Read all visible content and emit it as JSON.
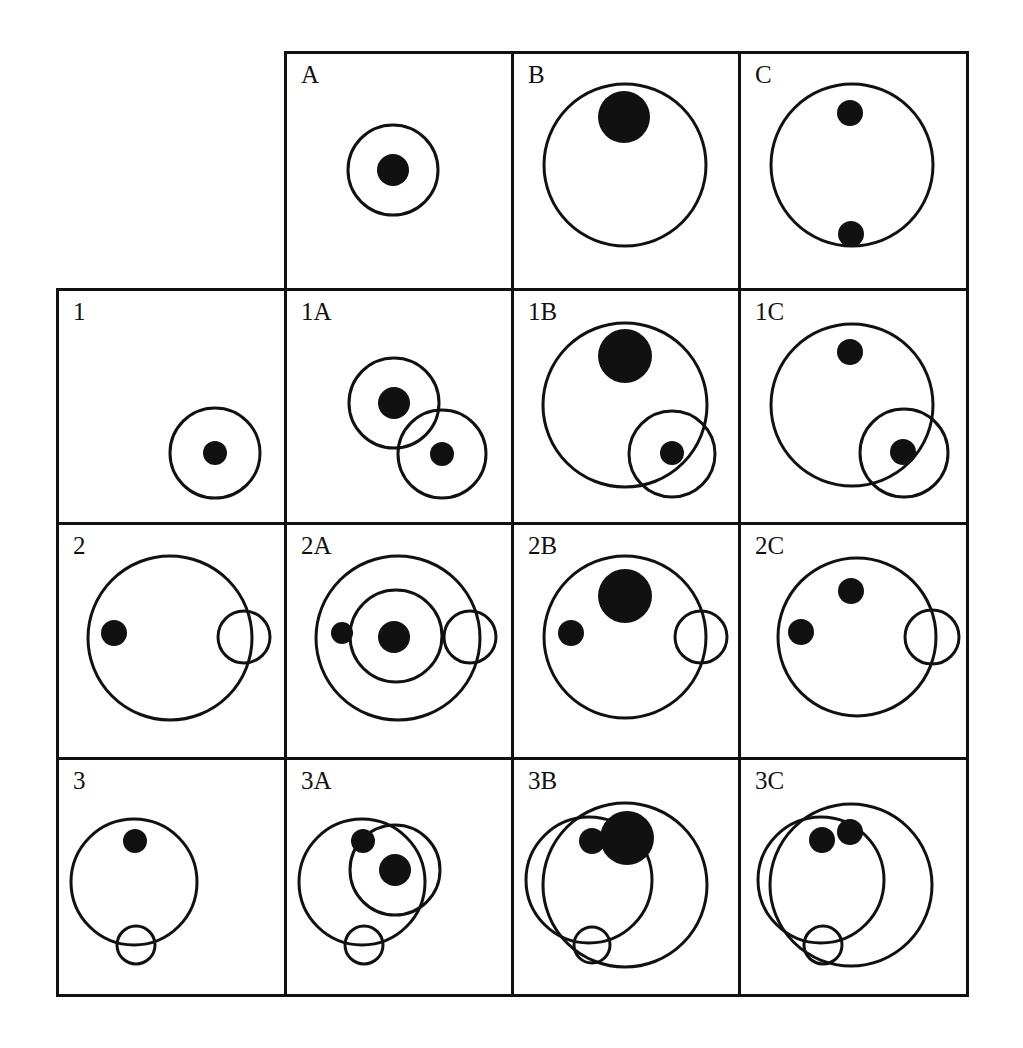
{
  "figure": {
    "title": "",
    "colors": {
      "stroke": "#111111",
      "fill": "#111111",
      "background": "#ffffff"
    },
    "grid": {
      "col_x": [
        57,
        285,
        512,
        739,
        967
      ],
      "row_y": [
        52,
        289,
        523,
        758,
        995
      ]
    },
    "cells": [
      {
        "id": "A",
        "label": "A",
        "row": 0,
        "col": 1,
        "rings": [
          {
            "cx": 108,
            "cy": 118,
            "r": 45
          }
        ],
        "dots": [
          {
            "cx": 108,
            "cy": 118,
            "r": 16
          }
        ]
      },
      {
        "id": "B",
        "label": "B",
        "row": 0,
        "col": 2,
        "rings": [
          {
            "cx": 113,
            "cy": 113,
            "r": 81
          }
        ],
        "dots": [
          {
            "cx": 112,
            "cy": 65,
            "r": 26
          }
        ]
      },
      {
        "id": "C",
        "label": "C",
        "row": 0,
        "col": 3,
        "rings": [
          {
            "cx": 113,
            "cy": 113,
            "r": 81
          }
        ],
        "dots": [
          {
            "cx": 111,
            "cy": 61,
            "r": 13
          },
          {
            "cx": 112,
            "cy": 182,
            "r": 13
          }
        ]
      },
      {
        "id": "1",
        "label": "1",
        "row": 1,
        "col": 0,
        "rings": [
          {
            "cx": 158,
            "cy": 164,
            "r": 45
          }
        ],
        "dots": [
          {
            "cx": 158,
            "cy": 164,
            "r": 12
          }
        ]
      },
      {
        "id": "1A",
        "label": "1A",
        "row": 1,
        "col": 1,
        "rings": [
          {
            "cx": 109,
            "cy": 114,
            "r": 45
          },
          {
            "cx": 157,
            "cy": 165,
            "r": 44
          }
        ],
        "dots": [
          {
            "cx": 109,
            "cy": 114,
            "r": 16
          },
          {
            "cx": 157,
            "cy": 165,
            "r": 12
          }
        ]
      },
      {
        "id": "1B",
        "label": "1B",
        "row": 1,
        "col": 2,
        "rings": [
          {
            "cx": 113,
            "cy": 116,
            "r": 82
          },
          {
            "cx": 160,
            "cy": 165,
            "r": 43
          }
        ],
        "dots": [
          {
            "cx": 113,
            "cy": 67,
            "r": 27
          },
          {
            "cx": 160,
            "cy": 164,
            "r": 12
          }
        ]
      },
      {
        "id": "1C",
        "label": "1C",
        "row": 1,
        "col": 3,
        "rings": [
          {
            "cx": 113,
            "cy": 116,
            "r": 81
          },
          {
            "cx": 165,
            "cy": 164,
            "r": 44
          }
        ],
        "dots": [
          {
            "cx": 111,
            "cy": 63,
            "r": 13
          },
          {
            "cx": 164,
            "cy": 163,
            "r": 13
          }
        ]
      },
      {
        "id": "2",
        "label": "2",
        "row": 2,
        "col": 0,
        "rings": [
          {
            "cx": 113,
            "cy": 115,
            "r": 82
          },
          {
            "cx": 187,
            "cy": 114,
            "r": 26
          }
        ],
        "dots": [
          {
            "cx": 57,
            "cy": 110,
            "r": 13
          }
        ]
      },
      {
        "id": "2A",
        "label": "2A",
        "row": 2,
        "col": 1,
        "rings": [
          {
            "cx": 113,
            "cy": 115,
            "r": 82
          },
          {
            "cx": 111,
            "cy": 113,
            "r": 46
          },
          {
            "cx": 185,
            "cy": 114,
            "r": 26
          }
        ],
        "dots": [
          {
            "cx": 57,
            "cy": 110,
            "r": 11
          },
          {
            "cx": 109,
            "cy": 114,
            "r": 16
          }
        ]
      },
      {
        "id": "2B",
        "label": "2B",
        "row": 2,
        "col": 2,
        "rings": [
          {
            "cx": 113,
            "cy": 114,
            "r": 81
          },
          {
            "cx": 189,
            "cy": 114,
            "r": 26
          }
        ],
        "dots": [
          {
            "cx": 113,
            "cy": 73,
            "r": 27
          },
          {
            "cx": 59,
            "cy": 110,
            "r": 13
          }
        ]
      },
      {
        "id": "2C",
        "label": "2C",
        "row": 2,
        "col": 3,
        "rings": [
          {
            "cx": 118,
            "cy": 114,
            "r": 79
          },
          {
            "cx": 193,
            "cy": 114,
            "r": 27
          }
        ],
        "dots": [
          {
            "cx": 112,
            "cy": 68,
            "r": 13
          },
          {
            "cx": 62,
            "cy": 109,
            "r": 13
          }
        ]
      },
      {
        "id": "3",
        "label": "3",
        "row": 3,
        "col": 0,
        "rings": [
          {
            "cx": 77,
            "cy": 124,
            "r": 63
          },
          {
            "cx": 79,
            "cy": 187,
            "r": 19
          }
        ],
        "dots": [
          {
            "cx": 78,
            "cy": 83,
            "r": 12
          }
        ]
      },
      {
        "id": "3A",
        "label": "3A",
        "row": 3,
        "col": 1,
        "rings": [
          {
            "cx": 77,
            "cy": 124,
            "r": 63
          },
          {
            "cx": 110,
            "cy": 112,
            "r": 45
          },
          {
            "cx": 79,
            "cy": 187,
            "r": 19
          }
        ],
        "dots": [
          {
            "cx": 78,
            "cy": 83,
            "r": 12
          },
          {
            "cx": 110,
            "cy": 112,
            "r": 16
          }
        ]
      },
      {
        "id": "3B",
        "label": "3B",
        "row": 3,
        "col": 2,
        "rings": [
          {
            "cx": 77,
            "cy": 122,
            "r": 63
          },
          {
            "cx": 113,
            "cy": 127,
            "r": 82
          },
          {
            "cx": 80,
            "cy": 187,
            "r": 18
          }
        ],
        "dots": [
          {
            "cx": 115,
            "cy": 80,
            "r": 27
          },
          {
            "cx": 80,
            "cy": 83,
            "r": 13
          }
        ]
      },
      {
        "id": "3C",
        "label": "3C",
        "row": 3,
        "col": 3,
        "rings": [
          {
            "cx": 82,
            "cy": 122,
            "r": 63
          },
          {
            "cx": 112,
            "cy": 127,
            "r": 81
          },
          {
            "cx": 84,
            "cy": 187,
            "r": 19
          }
        ],
        "dots": [
          {
            "cx": 83,
            "cy": 82,
            "r": 13
          },
          {
            "cx": 111,
            "cy": 74,
            "r": 13
          }
        ]
      }
    ]
  }
}
